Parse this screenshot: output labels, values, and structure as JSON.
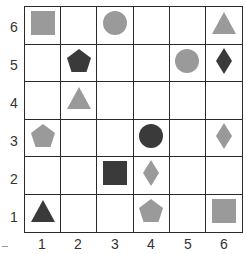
{
  "colors": {
    "gray": "#9a9a9a",
    "dark": "#3a3a3a",
    "grid_line": "#2a2a2a",
    "background": "#ffffff"
  },
  "axes": {
    "rows": [
      "6",
      "5",
      "4",
      "3",
      "2",
      "1"
    ],
    "columns": [
      "1",
      "2",
      "3",
      "4",
      "5",
      "6"
    ]
  },
  "shapes": [
    {
      "col": 1,
      "row": 6,
      "shape": "square",
      "color": "gray"
    },
    {
      "col": 3,
      "row": 6,
      "shape": "circle",
      "color": "gray"
    },
    {
      "col": 6,
      "row": 6,
      "shape": "triangle",
      "color": "gray"
    },
    {
      "col": 2,
      "row": 5,
      "shape": "pentagon",
      "color": "dark"
    },
    {
      "col": 5,
      "row": 5,
      "shape": "circle",
      "color": "gray"
    },
    {
      "col": 6,
      "row": 5,
      "shape": "diamond",
      "color": "dark"
    },
    {
      "col": 2,
      "row": 4,
      "shape": "triangle",
      "color": "gray"
    },
    {
      "col": 1,
      "row": 3,
      "shape": "pentagon",
      "color": "gray"
    },
    {
      "col": 4,
      "row": 3,
      "shape": "circle",
      "color": "dark"
    },
    {
      "col": 6,
      "row": 3,
      "shape": "diamond",
      "color": "gray"
    },
    {
      "col": 3,
      "row": 2,
      "shape": "square",
      "color": "dark"
    },
    {
      "col": 4,
      "row": 2,
      "shape": "diamond",
      "color": "gray"
    },
    {
      "col": 1,
      "row": 1,
      "shape": "triangle",
      "color": "dark"
    },
    {
      "col": 4,
      "row": 1,
      "shape": "pentagon",
      "color": "gray"
    },
    {
      "col": 6,
      "row": 1,
      "shape": "square",
      "color": "gray"
    }
  ]
}
